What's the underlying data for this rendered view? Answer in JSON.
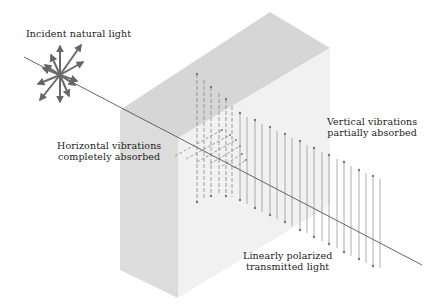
{
  "figure": {
    "labels": {
      "incident": "Incident natural light",
      "horizontal_line1": "Horizontal vibrations",
      "horizontal_line2": "completely absorbed",
      "vertical_line1": "Vertical vibrations",
      "vertical_line2": "partially absorbed",
      "transmitted_line1": "Linearly polarized",
      "transmitted_line2": "transmitted light"
    },
    "colors": {
      "slab_top": "#d6d6d6",
      "slab_front": "#dcdcdc",
      "slab_side": "#eeeeee",
      "ray": "#555555",
      "arrows": "#666666",
      "vibration_lines": "#888888",
      "text": "#222222"
    },
    "elements": {
      "incident_star_arrow_count": 12,
      "vertical_vibration_count": 20,
      "horizontal_vibration_count": 6
    }
  }
}
